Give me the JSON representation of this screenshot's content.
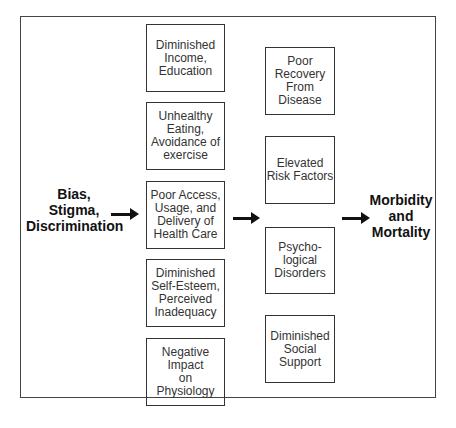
{
  "source": {
    "label": "Bias,\nStigma,\nDiscrimination"
  },
  "outcome": {
    "label": "Morbidity\nand\nMortality"
  },
  "column1": [
    {
      "label": "Diminished\nIncome,\nEducation"
    },
    {
      "label": "Unhealthy\nEating,\nAvoidance of\nexercise"
    },
    {
      "label": "Poor Access,\nUsage, and\nDelivery of\nHealth Care"
    },
    {
      "label": "Diminished\nSelf-Esteem,\nPerceived\nInadequacy"
    },
    {
      "label": "Negative\nImpact\non\nPhysiology"
    }
  ],
  "column2": [
    {
      "label": "Poor\nRecovery\nFrom\nDisease"
    },
    {
      "label": "Elevated\nRisk Factors"
    },
    {
      "label": "Psycho-\nlogical\nDisorders"
    },
    {
      "label": "Diminished\nSocial\nSupport"
    }
  ],
  "arrows": [
    {
      "from": "source",
      "to": "column1"
    },
    {
      "from": "column1",
      "to": "column2"
    },
    {
      "from": "column2",
      "to": "outcome"
    }
  ]
}
